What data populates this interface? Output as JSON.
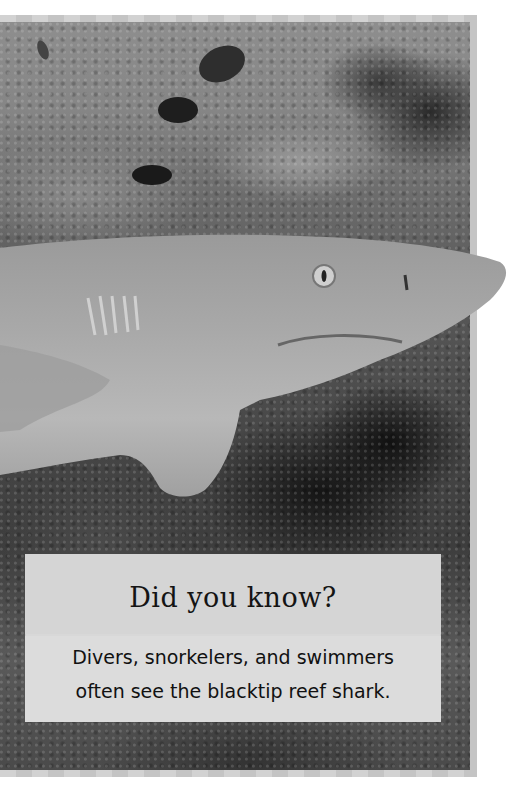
{
  "page": {
    "image_description": "Grayscale underwater photograph of a blacktip reef shark swimming over a coral reef with small fish",
    "frame_color": "#c8c8c8",
    "callout_color": "#d8d8d8"
  },
  "callout": {
    "title": "Did you know?",
    "lines": [
      "Divers, snorkelers, and swimmers",
      "often see the blacktip reef shark."
    ]
  }
}
